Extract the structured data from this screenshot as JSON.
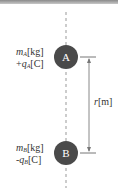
{
  "diagram": {
    "particles": [
      {
        "id": "A",
        "label": "A",
        "mass_var": "m",
        "mass_sub": "A",
        "mass_unit": "[kg]",
        "charge_sign": "+",
        "charge_var": "q",
        "charge_sub": "A",
        "charge_unit": "[C]"
      },
      {
        "id": "B",
        "label": "B",
        "mass_var": "m",
        "mass_sub": "B",
        "mass_unit": "[kg]",
        "charge_sign": "-",
        "charge_var": "q",
        "charge_sub": "B",
        "charge_unit": "[C]"
      }
    ],
    "distance": {
      "var": "r",
      "unit": "[m]"
    },
    "colors": {
      "ball": "#4a4a4a",
      "line": "#888888",
      "text": "#333333"
    }
  }
}
